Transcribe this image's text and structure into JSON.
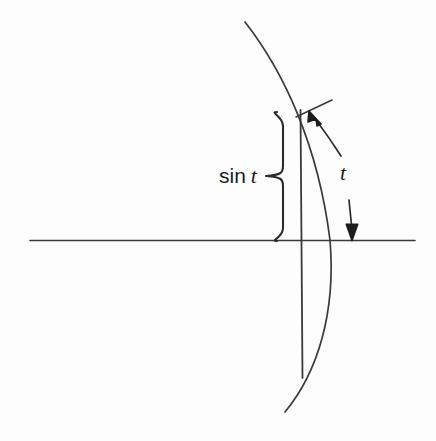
{
  "figure": {
    "background_color": "#fdfdfd",
    "stroke_color": "#2b2b2b",
    "labels": {
      "sine_prefix": "sin",
      "sine_variable": "t",
      "arc_parameter": "t"
    },
    "geometry": {
      "axis": {
        "x1": 30,
        "y1": 240,
        "x2": 415,
        "y2": 240
      },
      "chord": {
        "x1": 301,
        "y1": 110,
        "x2": 302,
        "y2": 378
      },
      "arc": {
        "start_x": 245,
        "start_y": 22,
        "axis_crossing_x": 330,
        "axis_crossing_y": 240,
        "end_x": 285,
        "end_y": 412
      },
      "tangent": {
        "x1": 296,
        "y1": 117,
        "x2": 332,
        "y2": 100
      },
      "brace": {
        "top_y": 112,
        "bottom_y": 241,
        "tip_x": 266,
        "tip_y": 176,
        "spine_x": 283
      },
      "arrow_to_tangent": {
        "tail_x": 341,
        "tail_y": 156,
        "tip_x": 309,
        "tip_y": 111
      },
      "arrow_down": {
        "tail_x": 349,
        "tail_y": 200,
        "tip_x": 352,
        "tip_y": 241
      }
    }
  }
}
